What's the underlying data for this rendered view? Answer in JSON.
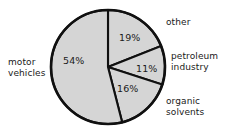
{
  "chart_data": {
    "type": "pie",
    "title": "",
    "subtitle": "",
    "xlabel": "",
    "ylabel": "",
    "legend_position": "outside-labels",
    "grid": false,
    "start_angle_deg": 0,
    "direction": "clockwise",
    "total": 100,
    "unit": "%",
    "slice_fill_color": "#d5d5d5",
    "outline_color": "#101010",
    "background_color": "#ffffff",
    "categories": [
      "other",
      "petroleum industry",
      "organic solvents",
      "motor vehicles"
    ],
    "values": [
      19,
      11,
      16,
      54
    ],
    "slices": [
      {
        "label": "other",
        "label_line1": "other",
        "label_line2": "",
        "value": 19,
        "value_text": "19%"
      },
      {
        "label": "petroleum industry",
        "label_line1": "petroleum",
        "label_line2": "industry",
        "value": 11,
        "value_text": "11%"
      },
      {
        "label": "organic solvents",
        "label_line1": "organic",
        "label_line2": "solvents",
        "value": 16,
        "value_text": "16%"
      },
      {
        "label": "motor vehicles",
        "label_line1": "motor",
        "label_line2": "vehicles",
        "value": 54,
        "value_text": "54%"
      }
    ]
  }
}
